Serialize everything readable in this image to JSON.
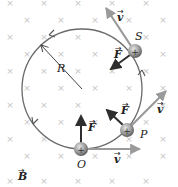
{
  "diagram": {
    "field_label": "B",
    "field_symbol": "×",
    "radius_label": "R",
    "colors": {
      "background": "#ffffff",
      "field_marks": "#c4c4c4",
      "circle": "#6a6a6a",
      "force_arrow": "#2e2e2e",
      "velocity_arrow": "#9a9a9a",
      "particle": "#9c9c9c",
      "text": "#222222"
    },
    "particles": [
      {
        "label": "O",
        "charge": "+",
        "force_label": "F",
        "velocity_label": "v"
      },
      {
        "label": "P",
        "charge": "+",
        "force_label": "F",
        "velocity_label": "v"
      },
      {
        "label": "S",
        "charge": "+",
        "force_label": "F",
        "velocity_label": "v"
      }
    ]
  }
}
